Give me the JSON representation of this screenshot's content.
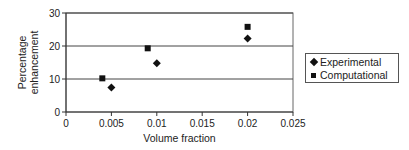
{
  "chart_data": {
    "type": "scatter",
    "title": "",
    "xlabel": "Volume fraction",
    "ylabel": "Percentage enhancement",
    "ylabel_lines": [
      "Percentage",
      "enhancement"
    ],
    "xlim": [
      0,
      0.025
    ],
    "ylim": [
      0,
      30
    ],
    "x_ticks": [
      0,
      0.005,
      0.01,
      0.015,
      0.02,
      0.025
    ],
    "x_tick_labels": [
      "0",
      "0.005",
      "0.01",
      "0.015",
      "0.02",
      "0.025"
    ],
    "y_ticks": [
      0,
      10,
      20,
      30
    ],
    "y_tick_labels": [
      "0",
      "10",
      "20",
      "30"
    ],
    "grid": {
      "horizontal": true,
      "vertical": false
    },
    "legend_position": "right",
    "series": [
      {
        "name": "Experimental",
        "marker": "diamond",
        "color": "#111111",
        "points": [
          {
            "x": 0.005,
            "y": 7.4
          },
          {
            "x": 0.01,
            "y": 14.8
          },
          {
            "x": 0.02,
            "y": 22.3
          }
        ]
      },
      {
        "name": "Computational",
        "marker": "square",
        "color": "#111111",
        "points": [
          {
            "x": 0.004,
            "y": 10.2
          },
          {
            "x": 0.009,
            "y": 19.3
          },
          {
            "x": 0.02,
            "y": 25.8
          }
        ]
      }
    ]
  },
  "legend": {
    "items": [
      {
        "label": "Experimental",
        "marker": "diamond"
      },
      {
        "label": "Computational",
        "marker": "square"
      }
    ]
  }
}
